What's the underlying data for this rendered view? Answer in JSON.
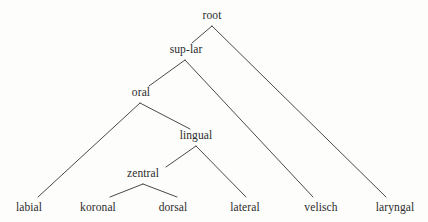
{
  "diagram": {
    "type": "tree",
    "title": "",
    "background_color": "#fdfdfb",
    "line_color": "#4a4a4a",
    "text_color": "#2b2b2b",
    "nodes": {
      "root": "root",
      "sup_lar": "sup-lar",
      "oral": "oral",
      "lingual": "lingual",
      "zentral": "zentral",
      "labial": "labial",
      "koronal": "koronal",
      "dorsal": "dorsal",
      "lateral": "lateral",
      "velisch": "velisch",
      "laryngal": "laryngal"
    },
    "node_positions": {
      "root": {
        "x": 212,
        "y": 16
      },
      "sup_lar": {
        "x": 186,
        "y": 50
      },
      "oral": {
        "x": 141,
        "y": 93
      },
      "lingual": {
        "x": 196,
        "y": 136
      },
      "zentral": {
        "x": 143,
        "y": 174
      },
      "labial": {
        "x": 29,
        "y": 208
      },
      "koronal": {
        "x": 98,
        "y": 208
      },
      "dorsal": {
        "x": 173,
        "y": 208
      },
      "lateral": {
        "x": 245,
        "y": 208
      },
      "velisch": {
        "x": 321,
        "y": 208
      },
      "laryngal": {
        "x": 395,
        "y": 208
      }
    },
    "edges": [
      {
        "from": "root",
        "to": "sup_lar",
        "x1": 212,
        "y1": 26,
        "x2": 192,
        "y2": 43
      },
      {
        "from": "root",
        "to": "laryngal",
        "x1": 212,
        "y1": 26,
        "x2": 386,
        "y2": 197
      },
      {
        "from": "sup_lar",
        "to": "oral",
        "x1": 185,
        "y1": 60,
        "x2": 149,
        "y2": 86
      },
      {
        "from": "sup_lar",
        "to": "velisch",
        "x1": 185,
        "y1": 60,
        "x2": 313,
        "y2": 197
      },
      {
        "from": "oral",
        "to": "labial",
        "x1": 140,
        "y1": 103,
        "x2": 38,
        "y2": 197
      },
      {
        "from": "oral",
        "to": "lingual",
        "x1": 140,
        "y1": 103,
        "x2": 190,
        "y2": 129
      },
      {
        "from": "lingual",
        "to": "zentral",
        "x1": 196,
        "y1": 146,
        "x2": 166,
        "y2": 167
      },
      {
        "from": "lingual",
        "to": "lateral",
        "x1": 196,
        "y1": 146,
        "x2": 246,
        "y2": 197
      },
      {
        "from": "zentral",
        "to": "koronal",
        "x1": 143,
        "y1": 184,
        "x2": 110,
        "y2": 197
      },
      {
        "from": "zentral",
        "to": "dorsal",
        "x1": 143,
        "y1": 184,
        "x2": 177,
        "y2": 197
      }
    ]
  }
}
